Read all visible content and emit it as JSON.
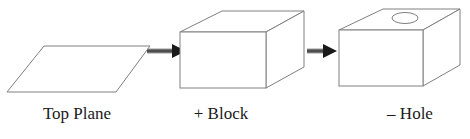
{
  "diagram": {
    "type": "process-flow",
    "steps": [
      {
        "id": "top-plane",
        "label": "Top Plane",
        "shape": "parallelogram"
      },
      {
        "id": "block",
        "label": "+ Block",
        "shape": "box"
      },
      {
        "id": "hole",
        "label": "– Hole",
        "shape": "box-with-hole"
      }
    ],
    "connectors": [
      {
        "from": "top-plane",
        "to": "block",
        "style": "arrow"
      },
      {
        "from": "block",
        "to": "hole",
        "style": "arrow"
      }
    ],
    "colors": {
      "background": "#ffffff",
      "outline": "#808080",
      "arrow": "#1a1a1a",
      "text": "#1a1a1a"
    }
  }
}
